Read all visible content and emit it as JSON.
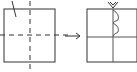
{
  "diagram": {
    "type": "paper-folding-cutting",
    "colors": {
      "background": "#ffffff",
      "stroke": "#333333",
      "light_stroke": "#666666"
    },
    "left_figure": {
      "shape": "square",
      "fold_lines": [
        "vertical-dashed",
        "horizontal-dashed"
      ],
      "cut_mark": "diagonal-line-top-left"
    },
    "arrow": {
      "direction": "right"
    },
    "right_figure": {
      "shape": "square",
      "divisions": [
        "vertical-solid",
        "horizontal-solid"
      ],
      "cut_pattern": "scalloped-notches-along-upper-vertical-line"
    }
  }
}
